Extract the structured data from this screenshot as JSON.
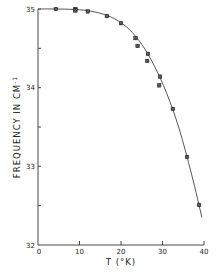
{
  "chart_data": {
    "type": "scatter",
    "title": "",
    "xlabel": "T (°K)",
    "ylabel": "FREQUENCY IN CM⁻¹",
    "xlim": [
      0,
      40
    ],
    "ylim": [
      32,
      35
    ],
    "x_ticks": [
      0,
      10,
      20,
      30,
      40
    ],
    "y_ticks": [
      32,
      33,
      34,
      35
    ],
    "x_minor_ticks": [],
    "y_minor_ticks": [
      32.5,
      33.5,
      34.5
    ],
    "grid": false,
    "legend": null,
    "series": [
      {
        "name": "measured",
        "marker": "x-square",
        "points": [
          [
            4.3,
            35.0
          ],
          [
            9.0,
            35.0
          ],
          [
            9.0,
            34.98
          ],
          [
            12.0,
            34.97
          ],
          [
            16.6,
            34.91
          ],
          [
            20.0,
            34.82
          ],
          [
            23.5,
            34.63
          ],
          [
            24.0,
            34.53
          ],
          [
            26.5,
            34.43
          ],
          [
            26.3,
            34.34
          ],
          [
            29.4,
            34.14
          ],
          [
            29.2,
            34.03
          ],
          [
            32.5,
            33.73
          ],
          [
            35.9,
            33.12
          ],
          [
            38.8,
            32.51
          ]
        ]
      },
      {
        "name": "fit",
        "marker": "line",
        "points": [
          [
            0,
            35.0
          ],
          [
            5,
            35.0
          ],
          [
            10,
            34.99
          ],
          [
            13,
            34.97
          ],
          [
            16,
            34.93
          ],
          [
            19,
            34.86
          ],
          [
            22,
            34.74
          ],
          [
            25,
            34.55
          ],
          [
            28,
            34.28
          ],
          [
            31,
            33.93
          ],
          [
            34,
            33.48
          ],
          [
            37,
            32.9
          ],
          [
            39.5,
            32.35
          ]
        ]
      }
    ]
  },
  "labels": {
    "x_tick_labels": [
      "0",
      "10",
      "20",
      "30",
      "40"
    ],
    "y_tick_labels": [
      "32",
      "33",
      "34",
      "35"
    ],
    "x_axis_title": "T   (°K)",
    "y_axis_title": "FREQUENCY   IN   CM",
    "y_axis_title_sup": "-1"
  }
}
